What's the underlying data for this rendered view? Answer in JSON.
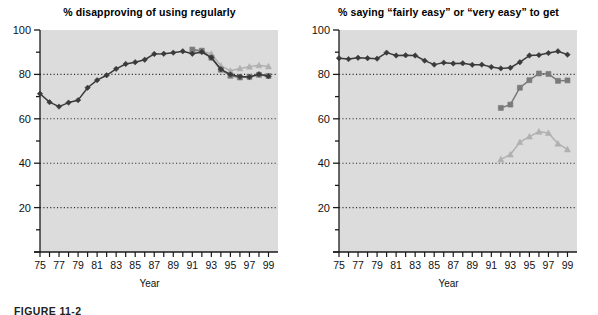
{
  "figure": {
    "caption": "FIGURE 11-2",
    "axis_label_x": "Year",
    "panels": [
      "left",
      "right"
    ]
  },
  "axes": {
    "y_ticks": [
      0,
      20,
      40,
      60,
      80,
      100
    ],
    "y_tick_labels": [
      "",
      "20",
      "40",
      "60",
      "80",
      "100"
    ],
    "y_min": 0,
    "y_max": 100,
    "x_min": 1975,
    "x_max": 2000,
    "x_tick_labels": [
      "75",
      "77",
      "79",
      "81",
      "83",
      "85",
      "87",
      "89",
      "91",
      "93",
      "95",
      "97",
      "99"
    ],
    "x_tick_years": [
      1975,
      1977,
      1979,
      1981,
      1983,
      1985,
      1987,
      1989,
      1991,
      1993,
      1995,
      1997,
      1999
    ],
    "gridlines_at": [
      20,
      40,
      60,
      80
    ],
    "grid_style": "dotted",
    "plot_background": "#dcdcdc"
  },
  "colors": {
    "series_diamond": "#3a3a3a",
    "series_square": "#7a7a7a",
    "series_triangle": "#b0b0b0",
    "grid": "#2b2b2b",
    "axis": "#1a1a1a",
    "text": "#111111"
  },
  "chart_data": [
    {
      "type": "line",
      "panel": "left",
      "title": "% disapproving of using regularly",
      "xlabel": "Year",
      "ylabel": "",
      "ylim": [
        0,
        100
      ],
      "xlim": [
        1975,
        2000
      ],
      "grid": true,
      "legend": "none",
      "x": [
        1975,
        1976,
        1977,
        1978,
        1979,
        1980,
        1981,
        1982,
        1983,
        1984,
        1985,
        1986,
        1987,
        1988,
        1989,
        1990,
        1991,
        1992,
        1993,
        1994,
        1995,
        1996,
        1997,
        1998,
        1999
      ],
      "series": [
        {
          "name": "12th graders",
          "marker": "diamond",
          "color": "#3a3a3a",
          "values": [
            71.3,
            67.5,
            65.5,
            67.3,
            68.4,
            74.0,
            77.4,
            79.6,
            82.5,
            84.7,
            85.5,
            86.6,
            89.2,
            89.3,
            89.8,
            90.4,
            89.3,
            90.1,
            87.6,
            82.3,
            80.0,
            79.0,
            78.8,
            80.1,
            79.2
          ]
        },
        {
          "name": "10th graders",
          "marker": "triangle",
          "color": "#b0b0b0",
          "values": [
            null,
            null,
            null,
            null,
            null,
            null,
            null,
            null,
            null,
            null,
            null,
            null,
            null,
            null,
            null,
            null,
            90.6,
            90.4,
            89.3,
            83.9,
            81.6,
            82.7,
            83.5,
            84.1,
            83.6
          ]
        },
        {
          "name": "8th graders",
          "marker": "square",
          "color": "#7a7a7a",
          "values": [
            null,
            null,
            null,
            null,
            null,
            null,
            null,
            null,
            null,
            null,
            null,
            null,
            null,
            null,
            null,
            null,
            91.2,
            90.7,
            87.5,
            82.1,
            79.4,
            78.6,
            78.9,
            79.8,
            79.3
          ]
        }
      ]
    },
    {
      "type": "line",
      "panel": "right",
      "title": "% saying “fairly easy” or “very easy” to get",
      "xlabel": "Year",
      "ylabel": "",
      "ylim": [
        0,
        100
      ],
      "xlim": [
        1975,
        2000
      ],
      "grid": true,
      "legend": "none",
      "x": [
        1975,
        1976,
        1977,
        1978,
        1979,
        1980,
        1981,
        1982,
        1983,
        1984,
        1985,
        1986,
        1987,
        1988,
        1989,
        1990,
        1991,
        1992,
        1993,
        1994,
        1995,
        1996,
        1997,
        1998,
        1999
      ],
      "series": [
        {
          "name": "12th graders",
          "marker": "diamond",
          "color": "#3a3a3a",
          "values": [
            87.3,
            86.9,
            87.5,
            87.3,
            87.1,
            89.8,
            88.5,
            88.6,
            88.5,
            86.2,
            84.4,
            85.3,
            84.9,
            85.0,
            84.3,
            84.4,
            83.3,
            82.7,
            83.0,
            85.5,
            88.5,
            88.7,
            89.6,
            90.4,
            88.9
          ]
        },
        {
          "name": "8th graders",
          "marker": "square",
          "color": "#7a7a7a",
          "values": [
            null,
            null,
            null,
            null,
            null,
            null,
            null,
            null,
            null,
            null,
            null,
            null,
            null,
            null,
            null,
            null,
            null,
            64.9,
            66.4,
            74.0,
            77.4,
            80.4,
            80.2,
            77.1,
            77.3
          ]
        },
        {
          "name": "10th graders",
          "marker": "triangle",
          "color": "#b0b0b0",
          "values": [
            null,
            null,
            null,
            null,
            null,
            null,
            null,
            null,
            null,
            null,
            null,
            null,
            null,
            null,
            null,
            null,
            null,
            41.7,
            43.9,
            49.5,
            52.0,
            54.2,
            53.6,
            48.8,
            46.2
          ]
        }
      ]
    }
  ]
}
